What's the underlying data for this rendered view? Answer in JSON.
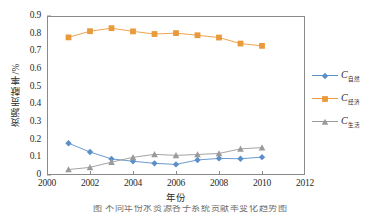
{
  "chart_data": {
    "type": "line",
    "title": "",
    "xlabel": "年份",
    "ylabel": "资源贡献率/%",
    "xlim": [
      2000,
      2012
    ],
    "ylim": [
      0,
      0.9
    ],
    "xticks": [
      "2000",
      "2002",
      "2004",
      "2006",
      "2008",
      "2010",
      "2012"
    ],
    "yticks": [
      "0",
      "0.1",
      "0.2",
      "0.3",
      "0.4",
      "0.5",
      "0.6",
      "0.7",
      "0.8",
      "0.9"
    ],
    "grid": false,
    "legend_position": "right",
    "x": [
      2001,
      2002,
      2003,
      2004,
      2005,
      2006,
      2007,
      2008,
      2009,
      2010
    ],
    "series": [
      {
        "name": "C自然",
        "label_base": "C",
        "label_sub": "自然",
        "color": "#5B8FC9",
        "marker": "diamond",
        "values": [
          0.18,
          0.13,
          0.091,
          0.078,
          0.066,
          0.06,
          0.085,
          0.094,
          0.092,
          0.101
        ]
      },
      {
        "name": "C经济",
        "label_base": "C",
        "label_sub": "经济",
        "color": "#E99A3C",
        "marker": "square",
        "values": [
          0.779,
          0.814,
          0.831,
          0.813,
          0.798,
          0.803,
          0.791,
          0.778,
          0.744,
          0.731
        ]
      },
      {
        "name": "C生活",
        "label_base": "C",
        "label_sub": "生活",
        "color": "#9A9A9A",
        "marker": "triangle",
        "values": [
          0.031,
          0.043,
          0.073,
          0.1,
          0.117,
          0.111,
          0.116,
          0.122,
          0.148,
          0.155
        ]
      }
    ]
  },
  "caption": {
    "sliver_text": "图    不同年份水资源各子系统贡献率变化趋势图"
  },
  "colors": {
    "axis": "#8a8a8a",
    "text": "#2b2b2b",
    "background": "#ffffff"
  }
}
